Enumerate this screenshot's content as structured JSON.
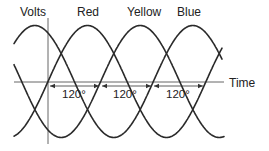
{
  "labels": {
    "y_axis": "Volts",
    "x_axis": "Time",
    "phases": [
      "Red",
      "Yellow",
      "Blue"
    ],
    "phase_shift": [
      "120°",
      "120°",
      "120°"
    ]
  },
  "diagram": {
    "type": "three-phase-sine-waves",
    "phase_offset_deg": 120,
    "phases": [
      {
        "name": "Red",
        "offset_deg": 0
      },
      {
        "name": "Yellow",
        "offset_deg": 120
      },
      {
        "name": "Blue",
        "offset_deg": 240
      }
    ]
  },
  "style": {
    "line_color": "#2a2a2a",
    "axis_color": "#555555",
    "background": "#ffffff"
  }
}
